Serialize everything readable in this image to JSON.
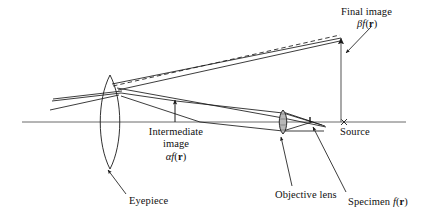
{
  "figure": {
    "kind": "optical-ray-diagram",
    "title_visible": false,
    "background_color": "#ffffff",
    "ink_color": "#1a1a1a"
  },
  "labels": {
    "final_image": {
      "line1": "Final image",
      "symbol_greek": "β",
      "symbol_func": "f",
      "symbol_arg_open": "(",
      "symbol_arg": "r",
      "symbol_arg_close": ")"
    },
    "intermediate_image": {
      "line1": "Intermediate",
      "line2": "image",
      "symbol_greek": "α",
      "symbol_func": "f",
      "symbol_arg_open": "(",
      "symbol_arg": "r",
      "symbol_arg_close": ")"
    },
    "source": {
      "text": "Source",
      "marker_glyph": "×"
    },
    "eyepiece": {
      "text": "Eyepiece"
    },
    "objective_lens": {
      "text": "Objective lens"
    },
    "specimen": {
      "text": "Specimen ",
      "symbol_func": "f",
      "symbol_arg_open": "(",
      "symbol_arg": "r",
      "symbol_arg_close": ")"
    }
  },
  "elements": {
    "optical_axis": {
      "name": "optical-axis",
      "y": 122,
      "x_start": 22,
      "x_end": 406
    },
    "eyepiece_lens": {
      "name": "eyepiece-lens",
      "cx": 110,
      "cy": 122,
      "rx": 11,
      "ry": 47
    },
    "objective_lens": {
      "name": "objective-lens",
      "cx": 283,
      "cy": 122,
      "rx": 3.6,
      "ry": 11
    },
    "specimen_point": {
      "name": "specimen-point",
      "x": 310,
      "y": 122
    },
    "source_marker": {
      "name": "source-marker",
      "x": 344,
      "y": 122
    },
    "intermediate_image_arrow": {
      "name": "intermediate-image-arrow",
      "x": 175,
      "y_base": 122,
      "y_tip": 99
    },
    "final_image_arrow": {
      "name": "final-image-arrow",
      "x": 341,
      "y_base": 122,
      "y_tip": 37
    }
  }
}
